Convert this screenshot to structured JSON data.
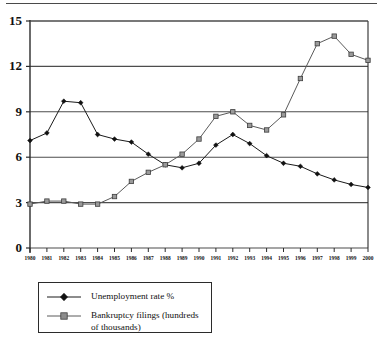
{
  "chart_data": {
    "type": "line",
    "title": "",
    "xlabel": "",
    "ylabel": "",
    "ylim": [
      0,
      15
    ],
    "yticks": [
      0,
      3,
      6,
      9,
      12,
      15
    ],
    "grid": true,
    "legend_position": "below-left",
    "categories": [
      "1980",
      "1981",
      "1982",
      "1983",
      "1984",
      "1985",
      "1986",
      "1987",
      "1988",
      "1989",
      "1990",
      "1991",
      "1992",
      "1993",
      "1994",
      "1995",
      "1996",
      "1997",
      "1998",
      "1999",
      "2000"
    ],
    "series": [
      {
        "name": "Unemployment rate %",
        "marker": "diamond",
        "values": [
          7.1,
          7.6,
          9.7,
          9.6,
          7.5,
          7.2,
          7.0,
          6.2,
          5.5,
          5.3,
          5.6,
          6.8,
          7.5,
          6.9,
          6.1,
          5.6,
          5.4,
          4.9,
          4.5,
          4.2,
          4.0
        ]
      },
      {
        "name": "Bankruptcy filings (hundreds of thousands)",
        "marker": "square",
        "values": [
          2.9,
          3.1,
          3.1,
          2.9,
          2.9,
          3.4,
          4.4,
          5.0,
          5.5,
          6.2,
          7.2,
          8.7,
          9.0,
          8.1,
          7.8,
          8.8,
          11.2,
          13.5,
          14.0,
          12.8,
          12.4
        ]
      }
    ],
    "axis": {
      "y_axis_label_format": "integer",
      "x_axis_label_format": "year"
    }
  },
  "legend": {
    "items": [
      {
        "label": "Unemployment rate %",
        "marker": "diamond-marker"
      },
      {
        "label": "Bankruptcy filings (hundreds\nof thousands)",
        "marker": "square-marker"
      }
    ]
  },
  "colors": {
    "series_unemployment": "#1a1a1a",
    "series_bankruptcy": "#5a5a5a",
    "grid": "#4d4d4d",
    "axis": "#2b2b2b",
    "background": "#ffffff"
  }
}
